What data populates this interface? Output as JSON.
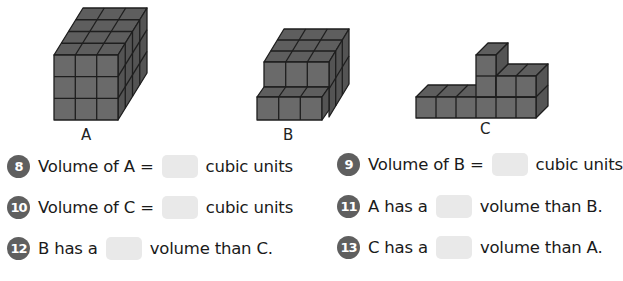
{
  "figures": [
    {
      "label": "A",
      "description": "rectangular prism of unit cubes, 3 wide x 3 high x 4 deep"
    },
    {
      "label": "B",
      "description": "stepped prism of unit cubes"
    },
    {
      "label": "C",
      "description": "L-shaped arrangement of unit cubes with a tower"
    }
  ],
  "questions": [
    {
      "number": "8",
      "before": "Volume of A =",
      "after": "cubic units"
    },
    {
      "number": "9",
      "before": "Volume of B =",
      "after": "cubic units"
    },
    {
      "number": "10",
      "before": "Volume of C =",
      "after": "cubic units"
    },
    {
      "number": "11",
      "before": "A has a",
      "after": "volume than B."
    },
    {
      "number": "12",
      "before": "B has a",
      "after": "volume than C."
    },
    {
      "number": "13",
      "before": "C has a",
      "after": "volume than A."
    }
  ],
  "colors": {
    "cube_face": "#6b6b6b",
    "cube_top": "#5e5e5e",
    "cube_side": "#555555",
    "edge": "#1e1e1e",
    "number_badge": "#5f5f5f",
    "blank": "#e9e9e9"
  }
}
